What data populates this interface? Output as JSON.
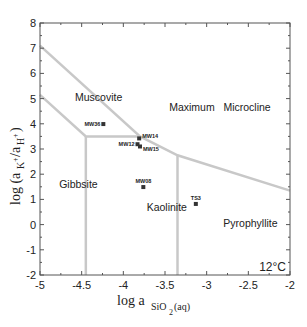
{
  "chart_data": {
    "type": "scatter",
    "title": "",
    "xlabel": "log a SiO2(aq)",
    "ylabel": "log (aK+/aH+)",
    "xlim": [
      -5,
      -2
    ],
    "ylim": [
      -2,
      8
    ],
    "x_ticks": [
      "-5",
      "-4.5",
      "-4",
      "-3.5",
      "-3",
      "-2.5",
      "-2"
    ],
    "x_tick_values": [
      -5,
      -4.5,
      -4,
      -3.5,
      -3,
      -2.5,
      -2
    ],
    "y_ticks": [
      "8",
      "7",
      "6",
      "5",
      "4",
      "3",
      "2",
      "1",
      "0",
      "-1",
      "-2"
    ],
    "y_tick_values": [
      8,
      7,
      6,
      5,
      4,
      3,
      2,
      1,
      0,
      -1,
      -2
    ],
    "grid": false,
    "annotation": "12°C",
    "regions": [
      {
        "name": "Muscovite",
        "x": -4.58,
        "y": 4.92
      },
      {
        "name": "Maximum   Microcline",
        "x": -3.45,
        "y": 4.52
      },
      {
        "name": "Gibbsite",
        "x": -4.77,
        "y": 1.45
      },
      {
        "name": "Kaolinite",
        "x": -3.72,
        "y": 0.55
      },
      {
        "name": "Pyrophyllite",
        "x": -2.8,
        "y": -0.1
      }
    ],
    "boundaries": [
      {
        "name": "microcline-muscovite/kaolinite/pyrophyllite",
        "points": [
          [
            -5,
            7.1
          ],
          [
            -3.8,
            3.5
          ],
          [
            -3.35,
            2.75
          ],
          [
            -2,
            1.35
          ]
        ]
      },
      {
        "name": "muscovite-gibbsite/kaolinite",
        "points": [
          [
            -5,
            5.15
          ],
          [
            -4.45,
            3.5
          ],
          [
            -3.8,
            3.5
          ]
        ]
      },
      {
        "name": "gibbsite-kaolinite",
        "points": [
          [
            -4.45,
            3.5
          ],
          [
            -4.45,
            -2
          ]
        ]
      },
      {
        "name": "kaolinite-pyrophyllite",
        "points": [
          [
            -3.35,
            2.75
          ],
          [
            -3.35,
            -2
          ]
        ]
      }
    ],
    "series": [
      {
        "name": "samples",
        "points": [
          {
            "label": "MW36",
            "x": -4.24,
            "y": 3.99
          },
          {
            "label": "MW14",
            "x": -3.81,
            "y": 3.42
          },
          {
            "label": "MW12",
            "x": -3.83,
            "y": 3.19
          },
          {
            "label": "MW15",
            "x": -3.8,
            "y": 3.1
          },
          {
            "label": "MW08",
            "x": -3.76,
            "y": 1.49
          },
          {
            "label": "TS3",
            "x": -3.13,
            "y": 0.82
          }
        ]
      }
    ],
    "colors": {
      "boundary": "#c8c8c8",
      "axis": "#555555",
      "marker": "#333333"
    }
  }
}
